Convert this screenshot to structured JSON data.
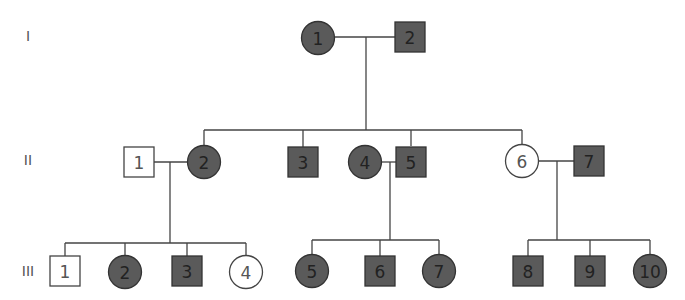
{
  "colors": {
    "affected": "#5a5a5a",
    "unaffected": "#ffffff",
    "stroke": "#333333",
    "line": "#444444"
  },
  "generations": [
    {
      "label": "I",
      "y": 36
    },
    {
      "label": "II",
      "y": 160
    },
    {
      "label": "III",
      "y": 271
    }
  ],
  "individuals": [
    {
      "id": "I-1",
      "label": "1",
      "sex": "female",
      "affected": true,
      "x": 318,
      "y": 38
    },
    {
      "id": "I-2",
      "label": "2",
      "sex": "male",
      "affected": true,
      "x": 410,
      "y": 37
    },
    {
      "id": "II-1",
      "label": "1",
      "sex": "male",
      "affected": false,
      "x": 139,
      "y": 162
    },
    {
      "id": "II-2",
      "label": "2",
      "sex": "female",
      "affected": true,
      "x": 204,
      "y": 162
    },
    {
      "id": "II-3",
      "label": "3",
      "sex": "male",
      "affected": true,
      "x": 303,
      "y": 162
    },
    {
      "id": "II-4",
      "label": "4",
      "sex": "female",
      "affected": true,
      "x": 365,
      "y": 162
    },
    {
      "id": "II-5",
      "label": "5",
      "sex": "male",
      "affected": true,
      "x": 411,
      "y": 162
    },
    {
      "id": "II-6",
      "label": "6",
      "sex": "female",
      "affected": false,
      "x": 522,
      "y": 161
    },
    {
      "id": "II-7",
      "label": "7",
      "sex": "male",
      "affected": true,
      "x": 589,
      "y": 161
    },
    {
      "id": "III-1",
      "label": "1",
      "sex": "male",
      "affected": false,
      "x": 65,
      "y": 271
    },
    {
      "id": "III-2",
      "label": "2",
      "sex": "female",
      "affected": true,
      "x": 125,
      "y": 272
    },
    {
      "id": "III-3",
      "label": "3",
      "sex": "male",
      "affected": true,
      "x": 187,
      "y": 271
    },
    {
      "id": "III-4",
      "label": "4",
      "sex": "female",
      "affected": false,
      "x": 246,
      "y": 272
    },
    {
      "id": "III-5",
      "label": "5",
      "sex": "female",
      "affected": true,
      "x": 312,
      "y": 271
    },
    {
      "id": "III-6",
      "label": "6",
      "sex": "male",
      "affected": true,
      "x": 380,
      "y": 271
    },
    {
      "id": "III-7",
      "label": "7",
      "sex": "female",
      "affected": true,
      "x": 439,
      "y": 271
    },
    {
      "id": "III-8",
      "label": "8",
      "sex": "male",
      "affected": true,
      "x": 528,
      "y": 271
    },
    {
      "id": "III-9",
      "label": "9",
      "sex": "male",
      "affected": true,
      "x": 590,
      "y": 271
    },
    {
      "id": "III-10",
      "label": "10",
      "sex": "female",
      "affected": true,
      "x": 650,
      "y": 271
    }
  ],
  "lines": [
    {
      "name": "couple-I1-I2",
      "points": [
        [
          335,
          37
        ],
        [
          396,
          37
        ]
      ]
    },
    {
      "name": "descent-I",
      "points": [
        [
          366,
          37
        ],
        [
          366,
          130
        ]
      ]
    },
    {
      "name": "sibship-II",
      "points": [
        [
          204,
          130
        ],
        [
          522,
          130
        ]
      ]
    },
    {
      "name": "drop-II2",
      "points": [
        [
          204,
          130
        ],
        [
          204,
          146
        ]
      ]
    },
    {
      "name": "drop-II3",
      "points": [
        [
          303,
          130
        ],
        [
          303,
          147
        ]
      ]
    },
    {
      "name": "drop-II5",
      "points": [
        [
          411,
          130
        ],
        [
          411,
          146
        ]
      ]
    },
    {
      "name": "drop-II6",
      "points": [
        [
          522,
          130
        ],
        [
          522,
          145
        ]
      ]
    },
    {
      "name": "couple-II1-II2",
      "points": [
        [
          153,
          162
        ],
        [
          188,
          162
        ]
      ]
    },
    {
      "name": "descent-II1-II2",
      "points": [
        [
          170,
          162
        ],
        [
          170,
          243
        ]
      ]
    },
    {
      "name": "couple-II4-II5",
      "points": [
        [
          381,
          162
        ],
        [
          396,
          162
        ]
      ]
    },
    {
      "name": "descent-II4-II5",
      "points": [
        [
          390,
          162
        ],
        [
          390,
          240
        ]
      ]
    },
    {
      "name": "couple-II6-II7",
      "points": [
        [
          538,
          161
        ],
        [
          575,
          161
        ]
      ]
    },
    {
      "name": "descent-II6-II7",
      "points": [
        [
          557,
          161
        ],
        [
          557,
          240
        ]
      ]
    },
    {
      "name": "sibship-III-a",
      "points": [
        [
          65,
          243
        ],
        [
          246,
          243
        ]
      ]
    },
    {
      "name": "drop-III1",
      "points": [
        [
          65,
          243
        ],
        [
          65,
          257
        ]
      ]
    },
    {
      "name": "drop-III2",
      "points": [
        [
          125,
          243
        ],
        [
          125,
          256
        ]
      ]
    },
    {
      "name": "drop-III3",
      "points": [
        [
          187,
          243
        ],
        [
          187,
          257
        ]
      ]
    },
    {
      "name": "drop-III4",
      "points": [
        [
          246,
          243
        ],
        [
          246,
          256
        ]
      ]
    },
    {
      "name": "sibship-III-b",
      "points": [
        [
          312,
          240
        ],
        [
          439,
          240
        ]
      ]
    },
    {
      "name": "drop-III5",
      "points": [
        [
          312,
          240
        ],
        [
          312,
          255
        ]
      ]
    },
    {
      "name": "drop-III6",
      "points": [
        [
          380,
          240
        ],
        [
          380,
          257
        ]
      ]
    },
    {
      "name": "drop-III7",
      "points": [
        [
          439,
          240
        ],
        [
          439,
          255
        ]
      ]
    },
    {
      "name": "sibship-III-c",
      "points": [
        [
          528,
          240
        ],
        [
          650,
          240
        ]
      ]
    },
    {
      "name": "drop-III8",
      "points": [
        [
          528,
          240
        ],
        [
          528,
          257
        ]
      ]
    },
    {
      "name": "drop-III9",
      "points": [
        [
          590,
          240
        ],
        [
          590,
          257
        ]
      ]
    },
    {
      "name": "drop-III10",
      "points": [
        [
          650,
          240
        ],
        [
          650,
          255
        ]
      ]
    }
  ]
}
